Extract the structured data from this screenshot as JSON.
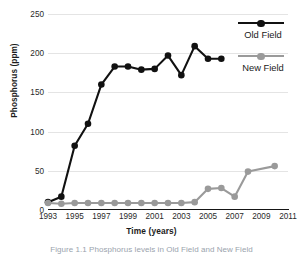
{
  "chart_data": {
    "type": "line",
    "title": "",
    "xlabel": "Time (years)",
    "ylabel": "Phosphorus (ppm)",
    "xlim": [
      1993,
      2011
    ],
    "ylim": [
      0,
      250
    ],
    "ytick_labels": [
      "0",
      "50",
      "100",
      "150",
      "200",
      "250"
    ],
    "yticks": [
      0,
      50,
      100,
      150,
      200,
      250
    ],
    "xtick_labels": [
      "1993",
      "1995",
      "1997",
      "1999",
      "2001",
      "2003",
      "2005",
      "2007",
      "2009",
      "2011"
    ],
    "xticks": [
      1993,
      1995,
      1997,
      1999,
      2001,
      2003,
      2005,
      2007,
      2009,
      2011
    ],
    "grid": true,
    "grid_axis": "y",
    "legend_position": "right",
    "series": [
      {
        "name": "Old Field",
        "color": "#111111",
        "marker": "circle",
        "x": [
          1993,
          1994,
          1995,
          1996,
          1997,
          1998,
          1999,
          2000,
          2001,
          2002,
          2003,
          2004,
          2005,
          2006
        ],
        "values": [
          10,
          17,
          82,
          110,
          160,
          183,
          183,
          179,
          180,
          197,
          172,
          209,
          193,
          193
        ]
      },
      {
        "name": "New Field",
        "color": "#9a9a9a",
        "marker": "circle",
        "x": [
          1993,
          1994,
          1995,
          1996,
          1997,
          1998,
          1999,
          2000,
          2001,
          2002,
          2003,
          2004,
          2005,
          2006,
          2007,
          2008,
          2010
        ],
        "values": [
          9,
          8,
          9,
          9,
          9,
          9,
          9,
          9,
          9,
          9,
          9,
          10,
          27,
          28,
          17,
          49,
          56
        ]
      }
    ]
  },
  "legend": {
    "items": [
      {
        "label": "Old Field",
        "color": "#111111"
      },
      {
        "label": "New Field",
        "color": "#9a9a9a"
      }
    ]
  },
  "caption": {
    "text": "Figure 1.1 Phosphorus levels in Old Field and New Field"
  }
}
